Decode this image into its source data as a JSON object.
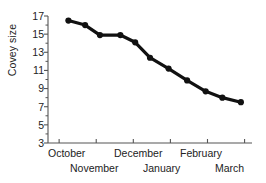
{
  "chart_data": {
    "type": "line",
    "title": "",
    "subtitle": "",
    "xlabel": "",
    "ylabel": "Covey size",
    "ylim": [
      3,
      17
    ],
    "xlim": [
      0,
      11
    ],
    "grid": false,
    "legend": null,
    "y_ticks": [
      17,
      15,
      13,
      11,
      9,
      7,
      5,
      3
    ],
    "y_minor_ticks": [
      16,
      14,
      12,
      10,
      8,
      6,
      4
    ],
    "x_tick_labels": [
      "October",
      "November",
      "December",
      "January",
      "February",
      "March"
    ],
    "x_tick_positions": [
      0.6,
      2.6,
      4.6,
      6.6,
      8.6,
      10.6
    ],
    "marker": "filled-circle",
    "line_color": "#111111",
    "marker_color": "#111111",
    "series": [
      {
        "name": "Covey size",
        "x": [
          1.1,
          2.0,
          2.8,
          3.9,
          4.7,
          5.5,
          6.5,
          7.5,
          8.5,
          9.4,
          10.4
        ],
        "values": [
          16.5,
          16.0,
          14.9,
          14.9,
          14.1,
          12.4,
          11.2,
          9.9,
          8.7,
          8.0,
          7.5
        ]
      }
    ]
  },
  "axis": {
    "y_tick_0": "17",
    "y_tick_1": "15",
    "y_tick_2": "13",
    "y_tick_3": "11",
    "y_tick_4": "9",
    "y_tick_5": "7",
    "y_tick_6": "5",
    "y_tick_7": "3",
    "x_label_0": "October",
    "x_label_1": "November",
    "x_label_2": "December",
    "x_label_3": "January",
    "x_label_4": "February",
    "x_label_5": "March",
    "y_axis_title": "Covey size"
  }
}
